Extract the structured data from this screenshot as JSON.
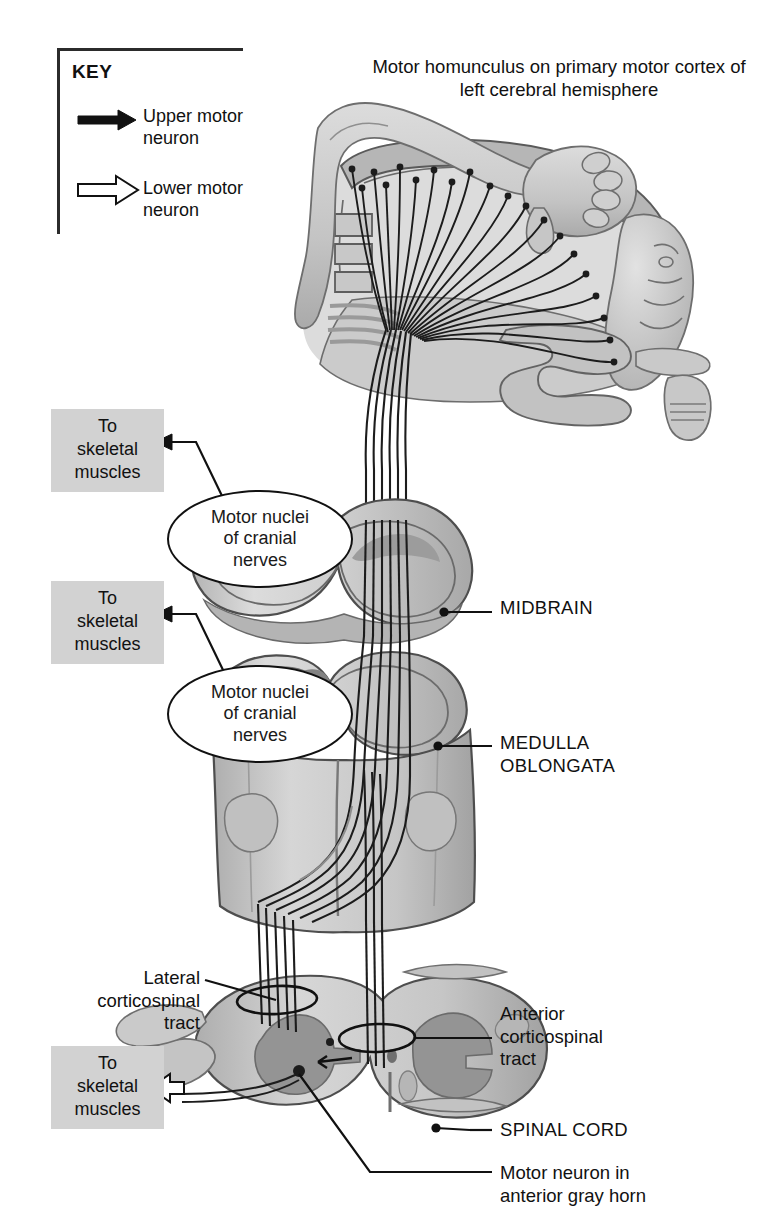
{
  "figure": {
    "title": "Motor homunculus on primary motor cortex of left cerebral hemisphere",
    "type": "anatomical-illustration"
  },
  "key": {
    "heading": "KEY",
    "items": [
      {
        "label": "Upper motor\nneuron",
        "arrow": "solid-arrow-icon",
        "color": "#111111"
      },
      {
        "label": "Lower motor\nneuron",
        "arrow": "hollow-arrow-icon",
        "color": "#ffffff"
      }
    ]
  },
  "muscle_boxes": [
    {
      "label": "To\nskeletal\nmuscles",
      "arrow": "solid-arrow-icon"
    },
    {
      "label": "To\nskeletal\nmuscles",
      "arrow": "solid-arrow-icon"
    },
    {
      "label": "To\nskeletal\nmuscles",
      "arrow": "hollow-arrow-icon"
    }
  ],
  "callouts": [
    {
      "label": "Motor nuclei\nof cranial\nnerves",
      "region": "midbrain"
    },
    {
      "label": "Motor nuclei\nof cranial\nnerves",
      "region": "medulla-oblongata"
    }
  ],
  "labels": {
    "midbrain": "MIDBRAIN",
    "medulla": "MEDULLA\nOBLONGATA",
    "spinal_cord": "SPINAL CORD",
    "lateral_tract": "Lateral\ncorticospinal\ntract",
    "anterior_tract": "Anterior\ncorticospinal\ntract",
    "motor_neuron": "Motor neuron in\nanterior gray horn"
  },
  "colors": {
    "ink": "#111111",
    "box_gray": "#d2d2d2",
    "tissue_light": "#d8d8d8",
    "tissue_mid": "#bcbcbc",
    "tissue_dark": "#9e9e9e",
    "outline": "#3a3a3a",
    "page": "#ffffff"
  }
}
